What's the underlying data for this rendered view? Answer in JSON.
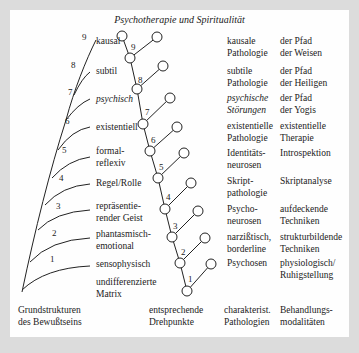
{
  "title": "Psychotherapie und Spiritualität",
  "structures": [
    {
      "level": "9",
      "label": "kausal"
    },
    {
      "level": "8",
      "label": "subtil"
    },
    {
      "level": "7",
      "label": "psychisch"
    },
    {
      "level": "6",
      "label": "existentiell"
    },
    {
      "level": "5",
      "label": "formal-\nreflexiv"
    },
    {
      "level": "4",
      "label": "Regel/Rolle"
    },
    {
      "level": "3",
      "label": "repräsentie-\nrender Geist"
    },
    {
      "level": "2",
      "label": "phantasmisch-\nemotional"
    },
    {
      "level": "1",
      "label": "sensophysisch"
    },
    {
      "level": "",
      "label": "undifferenzierte\nMatrix"
    }
  ],
  "fulcrums": [
    "9",
    "8",
    "7",
    "6",
    "5",
    "4",
    "3",
    "2",
    "1"
  ],
  "pathologies": [
    "kausale\nPathologie",
    "subtile\nPathologie",
    "psychische\nStörungen",
    "existentielle\nPathologie",
    "Identitäts-\nneurosen",
    "Skript-\npathologie",
    "Psycho-\nneurosen",
    "narzißtisch,\nborderline",
    "Psychosen"
  ],
  "treatments": [
    "der Pfad\nder Weisen",
    "der Pfad\nder Heiligen",
    "der Pfad\nder Yogis",
    "existentielle\nTherapie",
    "Introspektion",
    "Skriptanalyse",
    "aufdeckende\nTechniken",
    "strukturbildende\nTechniken",
    "physiologisch/\nRuhigstellung"
  ],
  "column_headers": {
    "structures": "Grundstrukturen\ndes Bewußtseins",
    "fulcrums": "entsprechende\nDrehpunkte",
    "pathologies": "charakterist.\nPathologien",
    "treatments": "Behandlungs-\nmodalitäten"
  }
}
